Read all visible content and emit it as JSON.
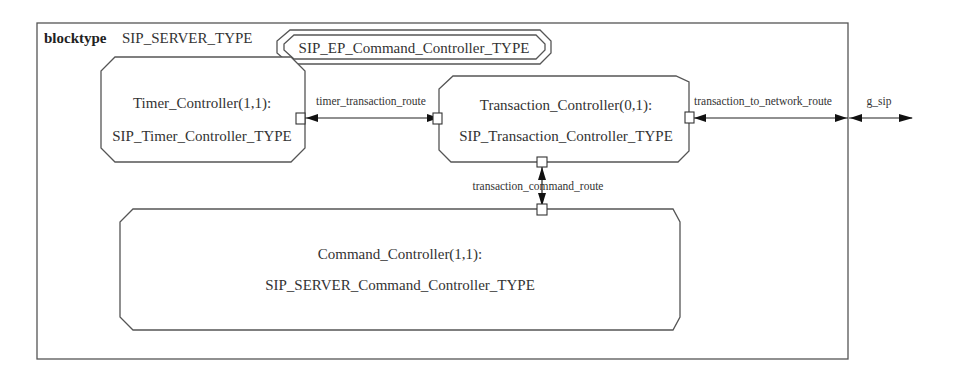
{
  "diagram": {
    "header": {
      "keyword": "blocktype",
      "name": "SIP_SERVER_TYPE"
    },
    "inherited_type": "SIP_EP_Command_Controller_TYPE",
    "blocks": [
      {
        "id": "timer",
        "instance": "Timer_Controller(1,1):",
        "type": "SIP_Timer_Controller_TYPE"
      },
      {
        "id": "transaction",
        "instance": "Transaction_Controller(0,1):",
        "type": "SIP_Transaction_Controller_TYPE"
      },
      {
        "id": "command",
        "instance": "Command_Controller(1,1):",
        "type": "SIP_SERVER_Command_Controller_TYPE"
      }
    ],
    "routes": [
      {
        "name": "timer_transaction_route",
        "from": "timer",
        "to": "transaction"
      },
      {
        "name": "transaction_to_network_route",
        "from": "transaction",
        "to": "frame"
      },
      {
        "name": "transaction_command_route",
        "from": "transaction",
        "to": "command"
      }
    ],
    "gates": [
      {
        "name": "g_sip"
      }
    ],
    "colors": {
      "stroke": "#555555",
      "text": "#333333",
      "arrow": "#111111",
      "background": "#ffffff"
    }
  }
}
